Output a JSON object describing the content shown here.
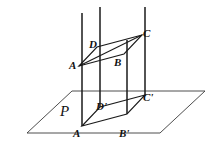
{
  "figure": {
    "stroke_color": "#1a1a1a",
    "plane_stroke_color": "#3a3a3a",
    "background_color": "#ffffff"
  },
  "plane": {
    "name_label": "P",
    "outline_points": "27,133 72,91 205,91 160,133",
    "label_position": {
      "x": 60,
      "y": 104
    }
  },
  "upper_parallelogram": {
    "name": "ABCD",
    "points": "79,66 97,47 142,35 124,54",
    "vertices": [
      {
        "id": "A",
        "label": "A",
        "x": 79,
        "y": 66,
        "label_x": 69,
        "label_y": 60
      },
      {
        "id": "B",
        "label": "B",
        "x": 124,
        "y": 54,
        "label_x": 114,
        "label_y": 57
      },
      {
        "id": "C",
        "label": "C",
        "x": 142,
        "y": 35,
        "label_x": 143,
        "label_y": 28
      },
      {
        "id": "D",
        "label": "D",
        "x": 97,
        "y": 47,
        "label_x": 89,
        "label_y": 39
      }
    ],
    "edges": [
      "A-D",
      "D-C",
      "C-B",
      "B-A",
      "A-C"
    ]
  },
  "lower_parallelogram": {
    "name": "A'B'C'D'",
    "points": "82,126 100,107 145,95 127,114",
    "vertices": [
      {
        "id": "A-prime",
        "label": "A",
        "x": 82,
        "y": 126,
        "label_x": 73,
        "label_y": 128
      },
      {
        "id": "B-prime",
        "label": "B'",
        "x": 127,
        "y": 114,
        "label_x": 119,
        "label_y": 128
      },
      {
        "id": "C-prime",
        "label": "C'",
        "x": 145,
        "y": 95,
        "label_x": 143,
        "label_y": 92
      },
      {
        "id": "D-prime",
        "label": "D'",
        "x": 100,
        "y": 107,
        "label_x": 96,
        "label_y": 101
      }
    ],
    "edges": [
      "A'-D'",
      "D'-C'",
      "C'-B'",
      "B'-A'"
    ]
  },
  "vertical_lines": [
    {
      "id": "line-through-A",
      "x1": 82,
      "y1": 13,
      "x2": 82,
      "y2": 126
    },
    {
      "id": "line-through-D",
      "x1": 100,
      "y1": 7,
      "x2": 100,
      "y2": 107
    },
    {
      "id": "line-through-B",
      "x1": 127,
      "y1": 40,
      "x2": 127,
      "y2": 114
    },
    {
      "id": "line-through-C",
      "x1": 145,
      "y1": 7,
      "x2": 145,
      "y2": 95
    }
  ],
  "notes": {
    "description": "Parallelogram ABCD above plane P with vertical projection lines descending to its projection A'B'C'D' in plane P. Diagonal AC is drawn in the upper parallelogram."
  }
}
